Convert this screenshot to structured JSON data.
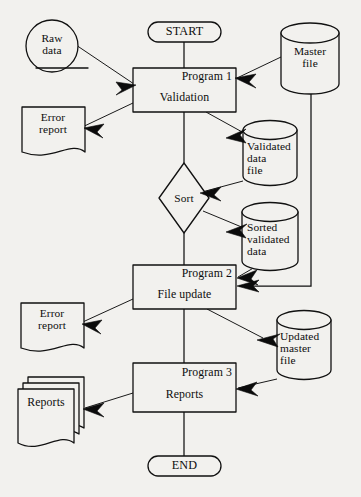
{
  "diagram": {
    "background_color": "#f2f1ee",
    "line_color": "#111111"
  },
  "nodes": {
    "start": {
      "label": "START",
      "shape": "terminator"
    },
    "end": {
      "label": "END",
      "shape": "terminator"
    },
    "raw_data": {
      "label": "Raw\ndata",
      "shape": "punched-card-circle"
    },
    "master_file": {
      "label": "Master\nfile",
      "shape": "cylinder"
    },
    "program1": {
      "header": "Program 1",
      "body": "Validation",
      "shape": "process"
    },
    "error_report_1": {
      "label": "Error\nreport",
      "shape": "document"
    },
    "validated_data_file": {
      "label": "Validated\ndata\nfile",
      "shape": "cylinder"
    },
    "sort": {
      "label": "Sort",
      "shape": "decision"
    },
    "sorted_validated_data": {
      "label": "Sorted\nvalidated\ndata",
      "shape": "cylinder"
    },
    "program2": {
      "header": "Program 2",
      "body": "File update",
      "shape": "process"
    },
    "error_report_2": {
      "label": "Error\nreport",
      "shape": "document"
    },
    "updated_master_file": {
      "label": "Updated\nmaster\nfile",
      "shape": "cylinder"
    },
    "program3": {
      "header": "Program 3",
      "body": "Reports",
      "shape": "process"
    },
    "reports": {
      "label": "Reports",
      "shape": "multi-document"
    }
  },
  "edges": [
    {
      "from": "start",
      "to": "program1",
      "kind": "plain"
    },
    {
      "from": "raw_data",
      "to": "program1",
      "kind": "arrow"
    },
    {
      "from": "master_file",
      "to": "program1",
      "kind": "arrow"
    },
    {
      "from": "program1",
      "to": "error_report_1",
      "kind": "arrow"
    },
    {
      "from": "program1",
      "to": "validated_data_file",
      "kind": "arrow"
    },
    {
      "from": "program1",
      "to": "sort",
      "kind": "plain"
    },
    {
      "from": "validated_data_file",
      "to": "sort",
      "kind": "arrow"
    },
    {
      "from": "sort",
      "to": "sorted_validated_data",
      "kind": "arrow"
    },
    {
      "from": "sort",
      "to": "program2",
      "kind": "plain"
    },
    {
      "from": "sorted_validated_data",
      "to": "program2",
      "kind": "arrow"
    },
    {
      "from": "master_file",
      "to": "program2",
      "kind": "arrow"
    },
    {
      "from": "program2",
      "to": "error_report_2",
      "kind": "arrow"
    },
    {
      "from": "program2",
      "to": "updated_master_file",
      "kind": "arrow"
    },
    {
      "from": "program2",
      "to": "program3",
      "kind": "plain"
    },
    {
      "from": "updated_master_file",
      "to": "program3",
      "kind": "arrow"
    },
    {
      "from": "program3",
      "to": "reports",
      "kind": "arrow"
    },
    {
      "from": "program3",
      "to": "end",
      "kind": "plain"
    }
  ]
}
